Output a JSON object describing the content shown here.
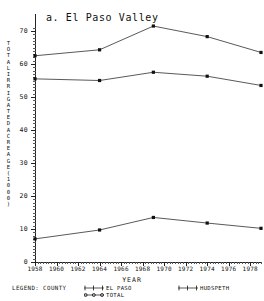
{
  "figure": {
    "title": "a. El Paso Valley",
    "axis_title_x": "YEAR",
    "axis_title_y_lines": [
      "T",
      "O",
      "T",
      "A",
      "L",
      "I",
      "R",
      "R",
      "I",
      "G",
      "A",
      "T",
      "E",
      "D",
      "A",
      "C",
      "R",
      "E",
      "A",
      "G",
      "E",
      "(",
      "1",
      "0",
      "0",
      "0",
      ")"
    ]
  },
  "legend": {
    "title": "LEGEND: COUNTY",
    "entries": [
      {
        "label": "EL PASO",
        "marker": "plus-marker"
      },
      {
        "label": "TOTAL",
        "marker": "circle-marker"
      },
      {
        "label": "HUDSPETH",
        "marker": "plus-marker"
      }
    ]
  },
  "chart_data": {
    "type": "line",
    "title": "a. El Paso Valley",
    "xlabel": "YEAR",
    "ylabel": "TOTAL IRRIGATED ACREAGE (1000)",
    "xlim": [
      1958,
      1979
    ],
    "ylim": [
      0,
      72
    ],
    "xticks": [
      1958,
      1960,
      1962,
      1964,
      1966,
      1968,
      1970,
      1972,
      1974,
      1976,
      1978
    ],
    "yticks": [
      0,
      10,
      20,
      30,
      40,
      50,
      60,
      70
    ],
    "grid": false,
    "legend_position": "bottom",
    "x": [
      1958,
      1964,
      1969,
      1974,
      1979
    ],
    "series": [
      {
        "name": "TOTAL",
        "values": [
          62.5,
          64.3,
          71.5,
          68.3,
          63.5
        ]
      },
      {
        "name": "EL PASO",
        "values": [
          55.5,
          55.0,
          57.5,
          56.3,
          53.5
        ]
      },
      {
        "name": "HUDSPETH",
        "values": [
          7.0,
          9.7,
          13.5,
          11.8,
          10.2
        ]
      }
    ]
  }
}
